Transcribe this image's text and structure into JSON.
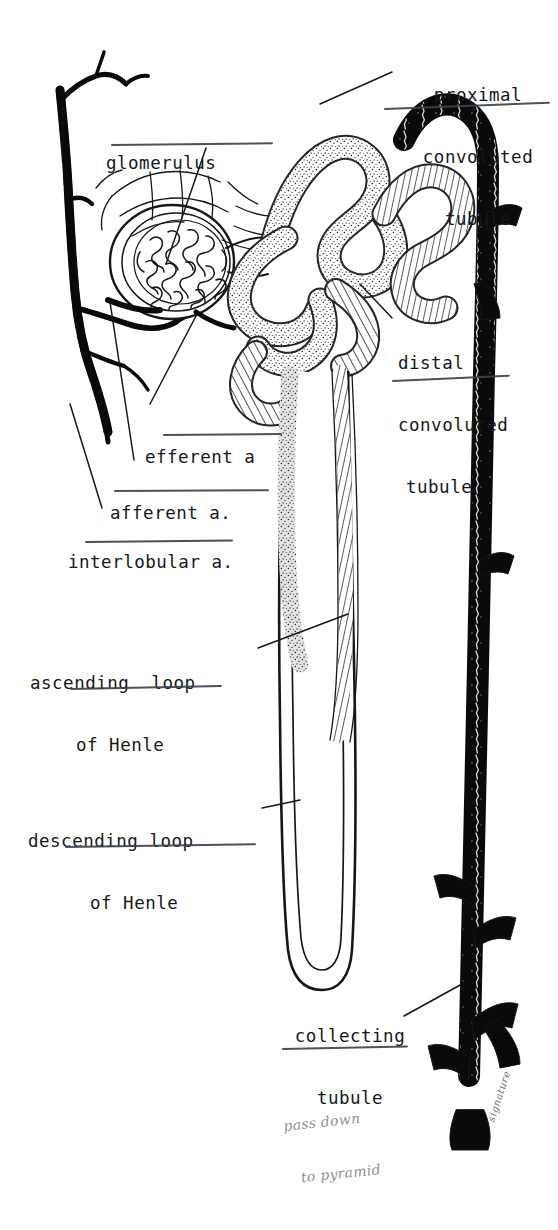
{
  "figure": {
    "ink_color": "#15171a",
    "rule_color": "#3b4450",
    "pencil_color": "#8e9096",
    "background": "#ffffff"
  },
  "labels": {
    "proximal": {
      "line1": "proximal",
      "line2": "convoluted",
      "line3": "tubule"
    },
    "glomerulus": {
      "line1": "glomerulus"
    },
    "distal": {
      "line1": "distal",
      "line2": "convoluted",
      "line3": "tubule"
    },
    "efferent": {
      "line1": "efferent a"
    },
    "afferent": {
      "line1": "afferent a."
    },
    "interlobular": {
      "line1": "interlobular a."
    },
    "ascending": {
      "line1": "ascending  loop",
      "line2": "of Henle"
    },
    "descending": {
      "line1": "descending loop",
      "line2": "of Henle"
    },
    "collecting": {
      "line1": "collecting",
      "line2": "tubule"
    }
  },
  "annotations": {
    "pencil_note": {
      "line1": "pass down",
      "line2": "to pyramid"
    },
    "signature": "signature"
  }
}
